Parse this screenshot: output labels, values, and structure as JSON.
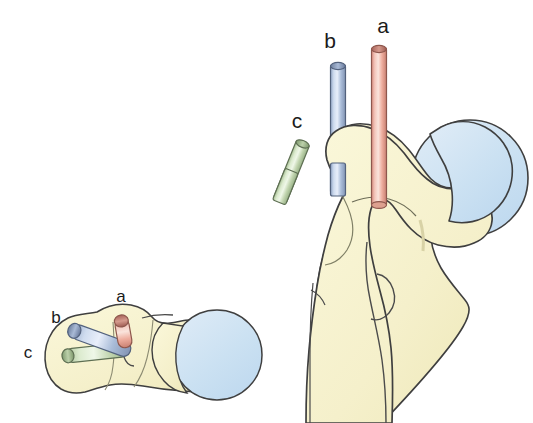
{
  "figure": {
    "background_color": "#ffffff",
    "outline_color": "#3a3a3a",
    "bone_fill": "#f7f3cf",
    "bone_shadow": "#efe9bd",
    "cartilage_fill": "#cfe3f2",
    "cartilage_edge": "#b9d6ec",
    "caption_text": "",
    "views": [
      {
        "name": "superior-view",
        "position": "left",
        "description": "Small superior (top-down) view of the proximal femur"
      },
      {
        "name": "anterior-view",
        "position": "right",
        "description": "Large anterior view of the proximal femur"
      }
    ]
  },
  "pins": [
    {
      "id": "a",
      "label": "a",
      "color": "#e8a79c",
      "color_light": "#f6d2c9",
      "color_dark": "#c4776b",
      "cap_color": "#b0675c",
      "description": "Anterior-most pin, vertical, longest"
    },
    {
      "id": "b",
      "label": "b",
      "color": "#b9c8e2",
      "color_light": "#dde6f4",
      "color_dark": "#8b9dbd",
      "cap_color": "#7a8dad",
      "description": "Middle pin, vertical"
    },
    {
      "id": "c",
      "label": "c",
      "color": "#cfe0c0",
      "color_light": "#e9f2e0",
      "color_dark": "#9bb489",
      "cap_color": "#8aa578",
      "description": "Posterior-most pin, angled, shortest"
    }
  ],
  "labels": {
    "large_view": [
      {
        "id": "a",
        "text": "a",
        "x": 383,
        "y": 33
      },
      {
        "id": "b",
        "text": "b",
        "x": 330,
        "y": 48
      },
      {
        "id": "c",
        "text": "c",
        "x": 297,
        "y": 128
      }
    ],
    "small_view": [
      {
        "id": "a",
        "text": "a",
        "x": 121,
        "y": 302
      },
      {
        "id": "b",
        "text": "b",
        "x": 56,
        "y": 323
      },
      {
        "id": "c",
        "text": "c",
        "x": 28,
        "y": 358
      }
    ]
  }
}
